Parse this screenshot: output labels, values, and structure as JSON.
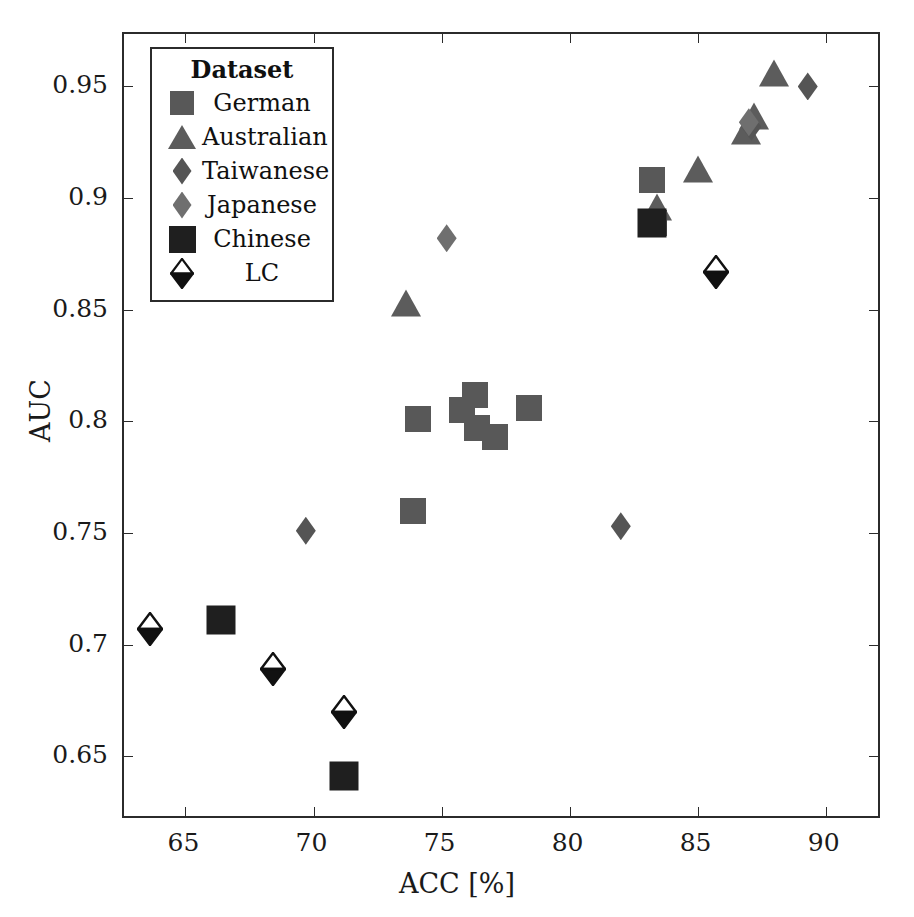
{
  "chart_data": {
    "type": "scatter",
    "title": "",
    "xlabel": "ACC [%]",
    "ylabel": "AUC",
    "xlim": [
      62.6,
      92.2
    ],
    "ylim": [
      0.6215,
      0.9735
    ],
    "xticks": [
      65,
      70,
      75,
      80,
      85,
      90
    ],
    "xticklabels": [
      "65",
      "70",
      "75",
      "80",
      "85",
      "90"
    ],
    "yticks": [
      0.65,
      0.7,
      0.75,
      0.8,
      0.85,
      0.9,
      0.95
    ],
    "yticklabels": [
      "0.65",
      "0.7",
      "0.75",
      "0.8",
      "0.85",
      "0.9",
      "0.95"
    ],
    "grid": false,
    "legend_position": "upper-left-inset",
    "legend_title": "Dataset",
    "series": [
      {
        "name": "German",
        "marker": "square",
        "color": "#585858",
        "points": [
          {
            "x": 73.9,
            "y": 0.76
          },
          {
            "x": 74.1,
            "y": 0.801
          },
          {
            "x": 75.8,
            "y": 0.805
          },
          {
            "x": 76.3,
            "y": 0.812
          },
          {
            "x": 76.4,
            "y": 0.797
          },
          {
            "x": 77.1,
            "y": 0.793
          },
          {
            "x": 78.4,
            "y": 0.806
          },
          {
            "x": 83.2,
            "y": 0.908
          },
          {
            "x": 83.3,
            "y": 0.889
          }
        ]
      },
      {
        "name": "Australian",
        "marker": "triangle",
        "color": "#5c5c5c",
        "points": [
          {
            "x": 73.6,
            "y": 0.853
          },
          {
            "x": 83.4,
            "y": 0.896
          },
          {
            "x": 85.0,
            "y": 0.913
          },
          {
            "x": 86.9,
            "y": 0.93
          },
          {
            "x": 87.2,
            "y": 0.937
          },
          {
            "x": 88.0,
            "y": 0.956
          }
        ]
      },
      {
        "name": "Taiwanese",
        "marker": "diamond",
        "color": "#555555",
        "points": [
          {
            "x": 69.7,
            "y": 0.751
          },
          {
            "x": 82.0,
            "y": 0.753
          },
          {
            "x": 87.1,
            "y": 0.932
          },
          {
            "x": 89.3,
            "y": 0.95
          }
        ]
      },
      {
        "name": "Japanese",
        "marker": "diamond",
        "color": "#6f6f6f",
        "points": [
          {
            "x": 75.2,
            "y": 0.882
          },
          {
            "x": 87.0,
            "y": 0.934
          }
        ]
      },
      {
        "name": "Chinese",
        "marker": "square",
        "color": "#1f1f1f",
        "points": [
          {
            "x": 66.4,
            "y": 0.711
          },
          {
            "x": 71.2,
            "y": 0.641
          },
          {
            "x": 83.2,
            "y": 0.889
          }
        ]
      },
      {
        "name": "LC",
        "marker": "half-diamond",
        "color": "#111111",
        "points": [
          {
            "x": 63.6,
            "y": 0.707
          },
          {
            "x": 68.4,
            "y": 0.689
          },
          {
            "x": 71.2,
            "y": 0.67
          },
          {
            "x": 85.7,
            "y": 0.867
          }
        ]
      }
    ]
  },
  "legend": {
    "title": "Dataset",
    "entries": [
      {
        "label": "German"
      },
      {
        "label": "Australian"
      },
      {
        "label": "Taiwanese"
      },
      {
        "label": "Japanese"
      },
      {
        "label": "Chinese"
      },
      {
        "label": "LC"
      }
    ]
  },
  "axes": {
    "x_label": "ACC [%]",
    "y_label": "AUC"
  }
}
